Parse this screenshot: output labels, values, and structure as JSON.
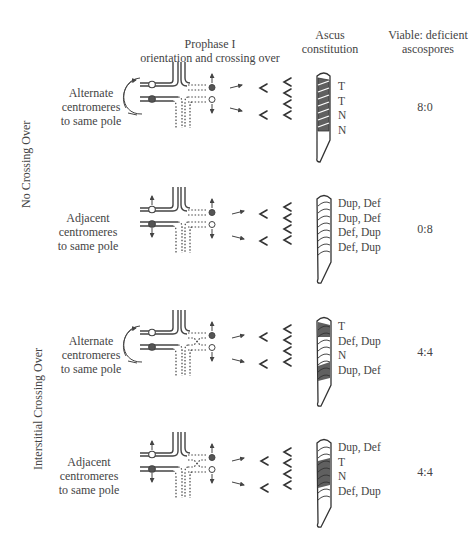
{
  "headers": {
    "prophase_line1": "Prophase I",
    "prophase_line2": "orientation and crossing over",
    "ascus_line1": "Ascus",
    "ascus_line2": "constitution",
    "viable_line1": "Viable: deficient",
    "viable_line2": "ascospores"
  },
  "groups": [
    {
      "label": "No Crossing Over"
    },
    {
      "label": "Interstitial Crossing Over"
    }
  ],
  "rows": [
    {
      "orientation_line1": "Alternate",
      "orientation_line2": "centromeres",
      "orientation_line3": "to same pole",
      "genotypes": [
        "T",
        "T",
        "N",
        "N"
      ],
      "ratio": "8:0"
    },
    {
      "orientation_line1": "Adjacent",
      "orientation_line2": "centromeres",
      "orientation_line3": "to same pole",
      "genotypes": [
        "Dup, Def",
        "Dup, Def",
        "Def, Dup",
        "Def, Dup"
      ],
      "ratio": "0:8"
    },
    {
      "orientation_line1": "Alternate",
      "orientation_line2": "centromeres",
      "orientation_line3": "to same pole",
      "genotypes": [
        "T",
        "Def, Dup",
        "N",
        "Dup, Def"
      ],
      "ratio": "4:4"
    },
    {
      "orientation_line1": "Adjacent",
      "orientation_line2": "centromeres",
      "orientation_line3": "to same pole",
      "genotypes": [
        "Dup, Def",
        "T",
        "N",
        "Def, Dup"
      ],
      "ratio": "4:4"
    }
  ],
  "colors": {
    "line": "#444444",
    "filled_centromere": "#555555",
    "shaded_spore": "#606060"
  }
}
